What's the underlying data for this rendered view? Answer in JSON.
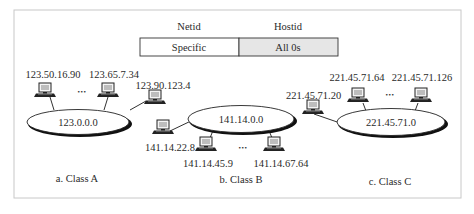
{
  "address_format": {
    "netid_header": "Netid",
    "hostid_header": "Hostid",
    "netid_value": "Specific",
    "hostid_value": "All 0s",
    "hostid_fill": "#e6e6e6"
  },
  "networks": [
    {
      "caption": "a. Class A",
      "network_address": "123.0.0.0",
      "hosts": [
        "123.50.16.90",
        "123.65.7.34",
        "123.90.123.4"
      ],
      "ellipsis": "•••"
    },
    {
      "caption": "b. Class B",
      "network_address": "141.14.0.0",
      "hosts": [
        "141.14.22.8",
        "141.14.45.9",
        "141.14.67.64"
      ],
      "ellipsis": "•••"
    },
    {
      "caption": "c. Class C",
      "network_address": "221.45.71.0",
      "hosts": [
        "221.45.71.20",
        "221.45.71.64",
        "221.45.71.126"
      ],
      "ellipsis": "•••"
    }
  ],
  "icons": {
    "host": "computer-icon"
  },
  "colors": {
    "frame": "#c8c8c8",
    "line": "#1a1a1a",
    "text": "#2a2a2a"
  }
}
